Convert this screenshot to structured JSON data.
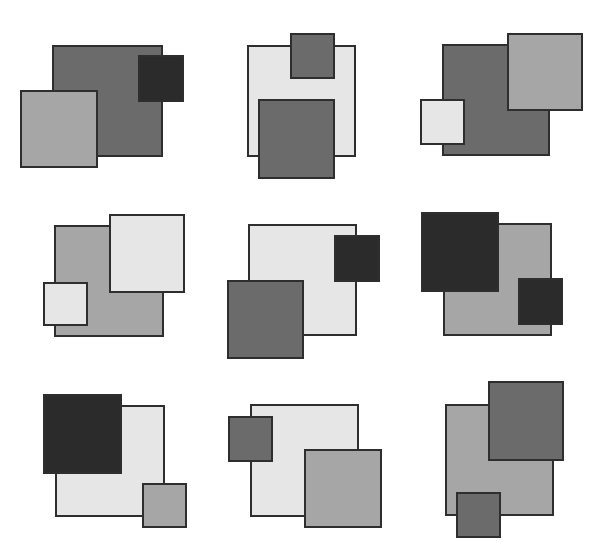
{
  "palette": {
    "dark": "#2b2b2b",
    "darkgray": "#6b6b6b",
    "lightgray": "#a6a6a6",
    "verylight": "#e6e6e6",
    "border": "#2e2e2e"
  },
  "panels": [
    {
      "id": 1,
      "squares": [
        {
          "x": 52,
          "y": 45,
          "w": 111,
          "h": 112,
          "shade": "darkgray"
        },
        {
          "x": 138,
          "y": 55,
          "w": 46,
          "h": 47,
          "shade": "dark"
        },
        {
          "x": 20,
          "y": 90,
          "w": 78,
          "h": 78,
          "shade": "lightgray"
        }
      ]
    },
    {
      "id": 2,
      "squares": [
        {
          "x": 247,
          "y": 45,
          "w": 109,
          "h": 112,
          "shade": "verylight"
        },
        {
          "x": 290,
          "y": 33,
          "w": 45,
          "h": 46,
          "shade": "darkgray"
        },
        {
          "x": 258,
          "y": 99,
          "w": 77,
          "h": 80,
          "shade": "darkgray"
        }
      ]
    },
    {
      "id": 3,
      "squares": [
        {
          "x": 442,
          "y": 44,
          "w": 108,
          "h": 112,
          "shade": "darkgray"
        },
        {
          "x": 507,
          "y": 33,
          "w": 76,
          "h": 78,
          "shade": "lightgray"
        },
        {
          "x": 420,
          "y": 99,
          "w": 45,
          "h": 46,
          "shade": "verylight"
        }
      ]
    },
    {
      "id": 4,
      "squares": [
        {
          "x": 54,
          "y": 225,
          "w": 110,
          "h": 112,
          "shade": "lightgray"
        },
        {
          "x": 109,
          "y": 214,
          "w": 76,
          "h": 79,
          "shade": "verylight"
        },
        {
          "x": 43,
          "y": 282,
          "w": 45,
          "h": 44,
          "shade": "verylight"
        }
      ]
    },
    {
      "id": 5,
      "squares": [
        {
          "x": 248,
          "y": 224,
          "w": 109,
          "h": 112,
          "shade": "verylight"
        },
        {
          "x": 334,
          "y": 235,
          "w": 46,
          "h": 47,
          "shade": "dark"
        },
        {
          "x": 227,
          "y": 280,
          "w": 77,
          "h": 79,
          "shade": "darkgray"
        }
      ]
    },
    {
      "id": 6,
      "squares": [
        {
          "x": 443,
          "y": 223,
          "w": 109,
          "h": 113,
          "shade": "lightgray"
        },
        {
          "x": 421,
          "y": 212,
          "w": 78,
          "h": 80,
          "shade": "dark"
        },
        {
          "x": 518,
          "y": 278,
          "w": 45,
          "h": 47,
          "shade": "dark"
        }
      ]
    },
    {
      "id": 7,
      "squares": [
        {
          "x": 55,
          "y": 405,
          "w": 110,
          "h": 112,
          "shade": "verylight"
        },
        {
          "x": 43,
          "y": 394,
          "w": 79,
          "h": 80,
          "shade": "dark"
        },
        {
          "x": 142,
          "y": 483,
          "w": 45,
          "h": 45,
          "shade": "lightgray"
        }
      ]
    },
    {
      "id": 8,
      "squares": [
        {
          "x": 250,
          "y": 404,
          "w": 109,
          "h": 113,
          "shade": "verylight"
        },
        {
          "x": 228,
          "y": 416,
          "w": 45,
          "h": 46,
          "shade": "darkgray"
        },
        {
          "x": 304,
          "y": 449,
          "w": 78,
          "h": 79,
          "shade": "lightgray"
        }
      ]
    },
    {
      "id": 9,
      "squares": [
        {
          "x": 445,
          "y": 404,
          "w": 109,
          "h": 112,
          "shade": "lightgray"
        },
        {
          "x": 488,
          "y": 381,
          "w": 76,
          "h": 80,
          "shade": "darkgray"
        },
        {
          "x": 456,
          "y": 492,
          "w": 45,
          "h": 46,
          "shade": "darkgray"
        }
      ]
    }
  ]
}
